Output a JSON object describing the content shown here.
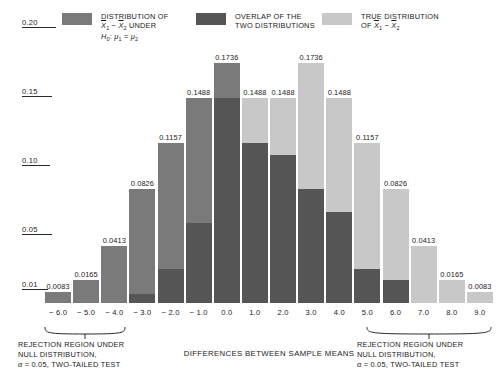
{
  "legend": {
    "items": [
      {
        "name": "null-distribution",
        "color": "#7a7a7a",
        "lines": [
          "DISTRIBUTION OF",
          "X̄1 − X̄2 UNDER",
          "H0: μ1 = μ2"
        ]
      },
      {
        "name": "overlap",
        "color": "#555555",
        "lines": [
          "OVERLAP OF THE",
          "TWO DISTRIBUTIONS"
        ]
      },
      {
        "name": "true-distribution",
        "color": "#c8c8c8",
        "lines": [
          "TRUE DISTRIBUTION",
          "OF X̄1 − X̄2"
        ]
      }
    ]
  },
  "axes": {
    "y_ticks": [
      "0.20",
      "0.15",
      "0.10",
      "0.05",
      "0.01"
    ],
    "x_title": "DIFFERENCES BETWEEN SAMPLE MEANS"
  },
  "captions": {
    "left": [
      "REJECTION REGION UNDER",
      "NULL DISTRIBUTION,",
      "α = 0.05, TWO-TAILED TEST"
    ],
    "right": [
      "REJECTION REGION UNDER",
      "NULL DISTRIBUTION,",
      "α = 0.05, TWO-TAILED TEST"
    ]
  },
  "chart_data": {
    "type": "bar",
    "title": "",
    "xlabel": "DIFFERENCES BETWEEN SAMPLE MEANS",
    "ylabel": "",
    "ylim": [
      0,
      0.2
    ],
    "grid": false,
    "stacked": true,
    "legend_position": "top",
    "categories": [
      "-6.0",
      "-5.0",
      "-4.0",
      "-3.0",
      "-2.0",
      "-1.0",
      "0.0",
      "1.0",
      "2.0",
      "3.0",
      "4.0",
      "5.0",
      "6.0",
      "7.0",
      "8.0",
      "9.0"
    ],
    "totals": [
      0.0083,
      0.0165,
      0.0413,
      0.0826,
      0.1157,
      0.1488,
      0.1736,
      0.1488,
      0.1488,
      0.1736,
      0.1488,
      0.1157,
      0.0826,
      0.0413,
      0.0165,
      0.0083
    ],
    "data_labels": [
      "0.0083",
      "0.0165",
      "0.0413",
      "0.0826",
      "0.1157",
      "0.1488",
      "0.1736",
      "0.1488",
      "0.1488",
      "0.1736",
      "0.1488",
      "0.1157",
      "0.0826",
      "0.0413",
      "0.0165",
      "0.0083"
    ],
    "series": [
      {
        "name": "DISTRIBUTION OF X̄1 − X̄2 UNDER H0: μ1 = μ2",
        "color": "#7a7a7a",
        "values": [
          0.0083,
          0.0165,
          0.0413,
          0.0759,
          0.0909,
          0.0909,
          0.0248,
          0.0,
          0.0,
          0.0,
          0.0,
          0.0,
          0.0,
          0.0,
          0.0,
          0.0
        ]
      },
      {
        "name": "OVERLAP OF THE TWO DISTRIBUTIONS",
        "color": "#555555",
        "values": [
          0.0,
          0.0,
          0.0,
          0.0067,
          0.0248,
          0.0579,
          0.1488,
          0.1157,
          0.1074,
          0.0826,
          0.0661,
          0.0248,
          0.0165,
          0.0,
          0.0,
          0.0
        ]
      },
      {
        "name": "TRUE DISTRIBUTION OF X̄1 − X̄2",
        "color": "#c8c8c8",
        "values": [
          0.0,
          0.0,
          0.0,
          0.0,
          0.0,
          0.0,
          0.0,
          0.0331,
          0.0414,
          0.091,
          0.0827,
          0.0909,
          0.0661,
          0.0413,
          0.0165,
          0.0083
        ]
      }
    ]
  }
}
